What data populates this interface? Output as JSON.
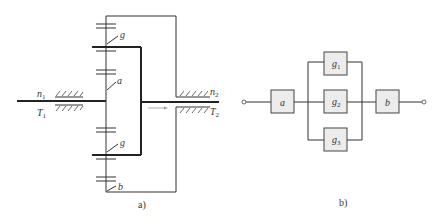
{
  "figure_a": {
    "caption": "a)",
    "input_labels": {
      "speed": "n",
      "speed_sub": "1",
      "torque": "T",
      "torque_sub": "1"
    },
    "output_labels": {
      "speed": "n",
      "speed_sub": "2",
      "torque": "T",
      "torque_sub": "2"
    },
    "gear_labels": {
      "planet_top": "g",
      "sun": "a",
      "planet_bottom": "g",
      "ring": "b"
    }
  },
  "figure_b": {
    "caption": "b)",
    "blocks": [
      {
        "id": "a",
        "label": "a",
        "sub": ""
      },
      {
        "id": "g1",
        "label": "g",
        "sub": "1"
      },
      {
        "id": "g2",
        "label": "g",
        "sub": "2"
      },
      {
        "id": "g3",
        "label": "g",
        "sub": "3"
      },
      {
        "id": "b",
        "label": "b",
        "sub": ""
      }
    ]
  }
}
